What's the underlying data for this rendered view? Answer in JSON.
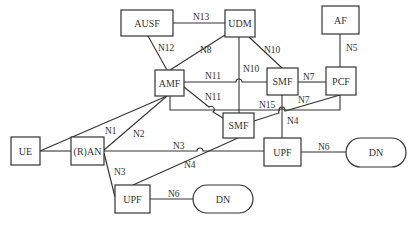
{
  "nodes": {
    "ausf": {
      "label": "AUSF"
    },
    "udm": {
      "label": "UDM"
    },
    "af": {
      "label": "AF"
    },
    "amf": {
      "label": "AMF"
    },
    "smf_upper": {
      "label": "SMF"
    },
    "pcf": {
      "label": "PCF"
    },
    "smf_lower": {
      "label": "SMF"
    },
    "ue": {
      "label": "UE"
    },
    "ran": {
      "label": "(R)AN"
    },
    "upf_upper": {
      "label": "UPF"
    },
    "dn_upper": {
      "label": "DN"
    },
    "upf_lower": {
      "label": "UPF"
    },
    "dn_lower": {
      "label": "DN"
    }
  },
  "edges": {
    "n13": {
      "label": "N13"
    },
    "n12": {
      "label": "N12"
    },
    "n8": {
      "label": "N8"
    },
    "n10_diag": {
      "label": "N10"
    },
    "n10_vert": {
      "label": "N10"
    },
    "n5": {
      "label": "N5"
    },
    "n11_upper": {
      "label": "N11"
    },
    "n11_lower": {
      "label": "N11"
    },
    "n7_upper": {
      "label": "N7"
    },
    "n7_lower": {
      "label": "N7"
    },
    "n15": {
      "label": "N15"
    },
    "n4_upper": {
      "label": "N4"
    },
    "n1": {
      "label": "N1"
    },
    "n2": {
      "label": "N2"
    },
    "n3_horiz": {
      "label": "N3"
    },
    "n3_diag": {
      "label": "N3"
    },
    "n4_lower": {
      "label": "N4"
    },
    "n6_upper": {
      "label": "N6"
    },
    "n6_lower": {
      "label": "N6"
    }
  }
}
